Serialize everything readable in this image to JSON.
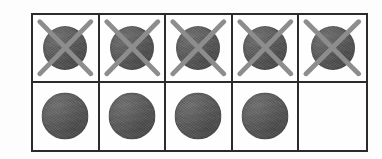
{
  "figure": {
    "type": "counting-grid",
    "background_color": "#fdfdfd",
    "border_color": "#2b2b2b",
    "token_color": "#585858",
    "cross_color": "#8d8d8d",
    "columns": 5,
    "rows": 2,
    "total_cells": 10,
    "total_tokens": 9,
    "crossed_out_tokens": 5,
    "remaining_tokens": 4,
    "empty_cells": 1
  },
  "grid": {
    "rows": [
      {
        "row_index": 1,
        "row_label": "top-row",
        "cells": [
          {
            "index": 1,
            "state": "crossed",
            "token": true,
            "cross": true
          },
          {
            "index": 2,
            "state": "crossed",
            "token": true,
            "cross": true
          },
          {
            "index": 3,
            "state": "crossed",
            "token": true,
            "cross": true
          },
          {
            "index": 4,
            "state": "crossed",
            "token": true,
            "cross": true
          },
          {
            "index": 5,
            "state": "crossed",
            "token": true,
            "cross": true
          }
        ]
      },
      {
        "row_index": 2,
        "row_label": "bottom-row",
        "cells": [
          {
            "index": 1,
            "state": "filled",
            "token": true,
            "cross": false
          },
          {
            "index": 2,
            "state": "filled",
            "token": true,
            "cross": false
          },
          {
            "index": 3,
            "state": "filled",
            "token": true,
            "cross": false
          },
          {
            "index": 4,
            "state": "filled",
            "token": true,
            "cross": false
          },
          {
            "index": 5,
            "state": "empty",
            "token": false,
            "cross": false
          }
        ]
      }
    ]
  }
}
